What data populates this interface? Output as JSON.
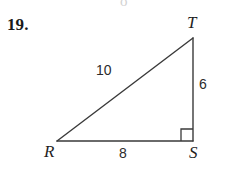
{
  "problem": {
    "number": "19."
  },
  "figure": {
    "type": "right-triangle",
    "vertices": [
      {
        "name": "T",
        "label": "T",
        "x": 193,
        "y": 38
      },
      {
        "name": "S",
        "label": "S",
        "x": 193,
        "y": 141
      },
      {
        "name": "R",
        "label": "R",
        "x": 57,
        "y": 141
      }
    ],
    "sides": [
      {
        "name": "hypotenuse-rt",
        "label": "10",
        "from": "R",
        "to": "T"
      },
      {
        "name": "leg-ts",
        "label": "6",
        "from": "T",
        "to": "S"
      },
      {
        "name": "leg-rs",
        "label": "8",
        "from": "R",
        "to": "S"
      }
    ],
    "right_angle_at": "S",
    "stroke_color": "#3a3a3a",
    "background_color": "#ffffff"
  },
  "artifacts": {
    "top_remnant": "o"
  }
}
